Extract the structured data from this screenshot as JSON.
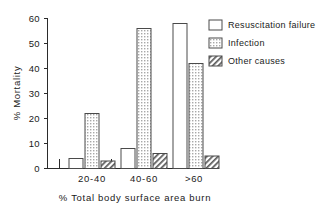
{
  "chart_data": {
    "type": "bar",
    "title": "",
    "xlabel": "% Total body surface area burn",
    "ylabel": "% Mortality",
    "categories": [
      "20-40",
      "40-60",
      ">60"
    ],
    "series": [
      {
        "name": "Resuscitation failure",
        "fill": "open",
        "values": [
          4,
          8,
          58
        ]
      },
      {
        "name": "Infection",
        "fill": "dotted",
        "values": [
          22,
          56,
          42
        ]
      },
      {
        "name": "Other causes",
        "fill": "hatched",
        "values": [
          3,
          6,
          5
        ]
      }
    ],
    "ylim": [
      0,
      60
    ],
    "yticks": [
      0,
      10,
      20,
      30,
      40,
      50,
      60
    ],
    "ytick_labels": [
      "0",
      "10",
      "20",
      "30",
      "40",
      "50",
      "60"
    ],
    "grid": false,
    "legend_position": "top-right"
  },
  "legend": {
    "items": [
      {
        "label": "Resuscitation failure"
      },
      {
        "label": "Infection"
      },
      {
        "label": "Other causes"
      }
    ]
  },
  "axes": {
    "y_title": "% Mortality",
    "x_title": "% Total body surface area burn",
    "y_ticks": [
      "60",
      "50",
      "40",
      "30",
      "20",
      "10",
      "0"
    ],
    "x_ticks": [
      "20-40",
      "40-60",
      ">60"
    ]
  },
  "colors": {
    "axis": "#2b2b2b",
    "bar_outline": "#4a4a4a",
    "dotted_fill": "#d9d9d9",
    "hatched_fill": "#ffffff",
    "open_fill": "#ffffff",
    "background": "#ffffff"
  }
}
